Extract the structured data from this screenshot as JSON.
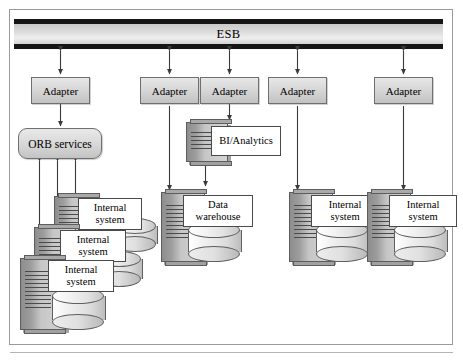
{
  "diagram": {
    "bus": {
      "label": "ESB"
    },
    "adapters": [
      {
        "label": "Adapter",
        "id": "adapter-orb"
      },
      {
        "label": "Adapter",
        "id": "adapter-data-warehouse"
      },
      {
        "label": "Adapter",
        "id": "adapter-bi-analytics"
      },
      {
        "label": "Adapter",
        "id": "adapter-internal-system-4"
      },
      {
        "label": "Adapter",
        "id": "adapter-internal-system-5"
      }
    ],
    "orb": {
      "label": "ORB services"
    },
    "nodes": [
      {
        "id": "internal-system-1",
        "label": "Internal\nsystem",
        "line1": "Internal",
        "line2": "system"
      },
      {
        "id": "internal-system-2",
        "label": "Internal\nsystem",
        "line1": "Internal",
        "line2": "system"
      },
      {
        "id": "internal-system-3",
        "label": "Internal\nsystem",
        "line1": "Internal",
        "line2": "system"
      },
      {
        "id": "bi-analytics",
        "label": "BI/Analytics",
        "line1": "BI/Analytics",
        "line2": ""
      },
      {
        "id": "data-warehouse",
        "label": "Data\nwarehouse",
        "line1": "Data",
        "line2": "warehouse"
      },
      {
        "id": "internal-system-4",
        "label": "Internal\nsystem",
        "line1": "Internal",
        "line2": "system"
      },
      {
        "id": "internal-system-5",
        "label": "Internal\nsystem",
        "line1": "Internal",
        "line2": "system"
      }
    ],
    "colors": {
      "bus_band": "#161616",
      "bus_core": "#dcdcdc",
      "box_fill": "#d7d7d7",
      "box_stroke": "#6f6f6f",
      "node_tower": "#9d9d9d",
      "label_fill": "#ffffff",
      "connector": "#3a3a3a",
      "frame": "#9a9a9a"
    }
  }
}
